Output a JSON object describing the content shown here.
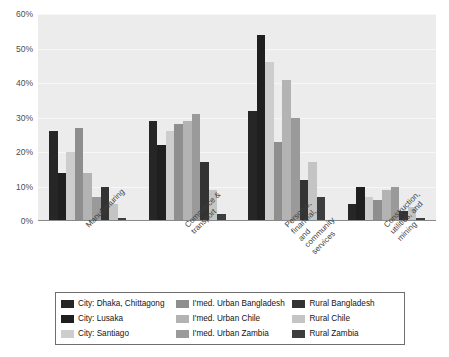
{
  "chart_data": {
    "type": "bar",
    "title": "",
    "subtitle": "",
    "xlabel": "",
    "ylabel": "",
    "ylim": [
      0,
      60
    ],
    "yticks": [
      "0%",
      "10%",
      "20%",
      "30%",
      "40%",
      "50%",
      "60%"
    ],
    "ytick_values": [
      0,
      10,
      20,
      30,
      40,
      50,
      60
    ],
    "grid": true,
    "legend_position": "bottom",
    "categories": [
      "Manufacturing",
      "Commerce &\ntransport",
      "Personal, financial,\nand community\nservices",
      "Construction,\nutilities, and mining"
    ],
    "series": [
      {
        "name": "City: Dhaka, Chittagong",
        "color": "#262626",
        "values": [
          26,
          29,
          32,
          5
        ]
      },
      {
        "name": "City: Lusaka",
        "color": "#1f1f1f",
        "values": [
          14,
          22,
          54,
          10
        ]
      },
      {
        "name": "City: Santiago",
        "color": "#cdcdcd",
        "values": [
          20,
          26,
          46,
          7
        ]
      },
      {
        "name": "I'med. Urban Bangladesh",
        "color": "#8e8e8e",
        "values": [
          27,
          28,
          23,
          6
        ]
      },
      {
        "name": "I'med. Urban Chile",
        "color": "#b3b3b3",
        "values": [
          14,
          29,
          41,
          9
        ]
      },
      {
        "name": "I'med. Urban Zambia",
        "color": "#9a9a9a",
        "values": [
          7,
          31,
          30,
          10
        ]
      },
      {
        "name": "Rural Bangladesh",
        "color": "#333333",
        "values": [
          10,
          17,
          12,
          3
        ]
      },
      {
        "name": "Rural Chile",
        "color": "#c4c4c4",
        "values": [
          5,
          9,
          17,
          4
        ]
      },
      {
        "name": "Rural Zambia",
        "color": "#3d3d3d",
        "values": [
          1,
          2,
          7,
          1
        ]
      }
    ]
  },
  "legend": {
    "columns": [
      {
        "items": [
          {
            "label": "City: Dhaka, Chittagong",
            "color": "#262626"
          },
          {
            "label": "City: Lusaka",
            "color": "#1f1f1f"
          },
          {
            "label": "City: Santiago",
            "color": "#cdcdcd"
          }
        ]
      },
      {
        "items": [
          {
            "label": "I'med. Urban Bangladesh",
            "color": "#8e8e8e"
          },
          {
            "label": "I'med. Urban Chile",
            "color": "#b3b3b3"
          },
          {
            "label": "I'med. Urban Zambia",
            "color": "#9a9a9a"
          }
        ]
      },
      {
        "items": [
          {
            "label": "Rural Bangladesh",
            "color": "#333333"
          },
          {
            "label": "Rural Chile",
            "color": "#c4c4c4"
          },
          {
            "label": "Rural Zambia",
            "color": "#3d3d3d"
          }
        ]
      }
    ]
  },
  "style": {
    "plot_background": "#ececec",
    "gridline_color": "#f7f7f7",
    "axis_color": "#8a8a8a",
    "page_background": "#ffffff"
  }
}
